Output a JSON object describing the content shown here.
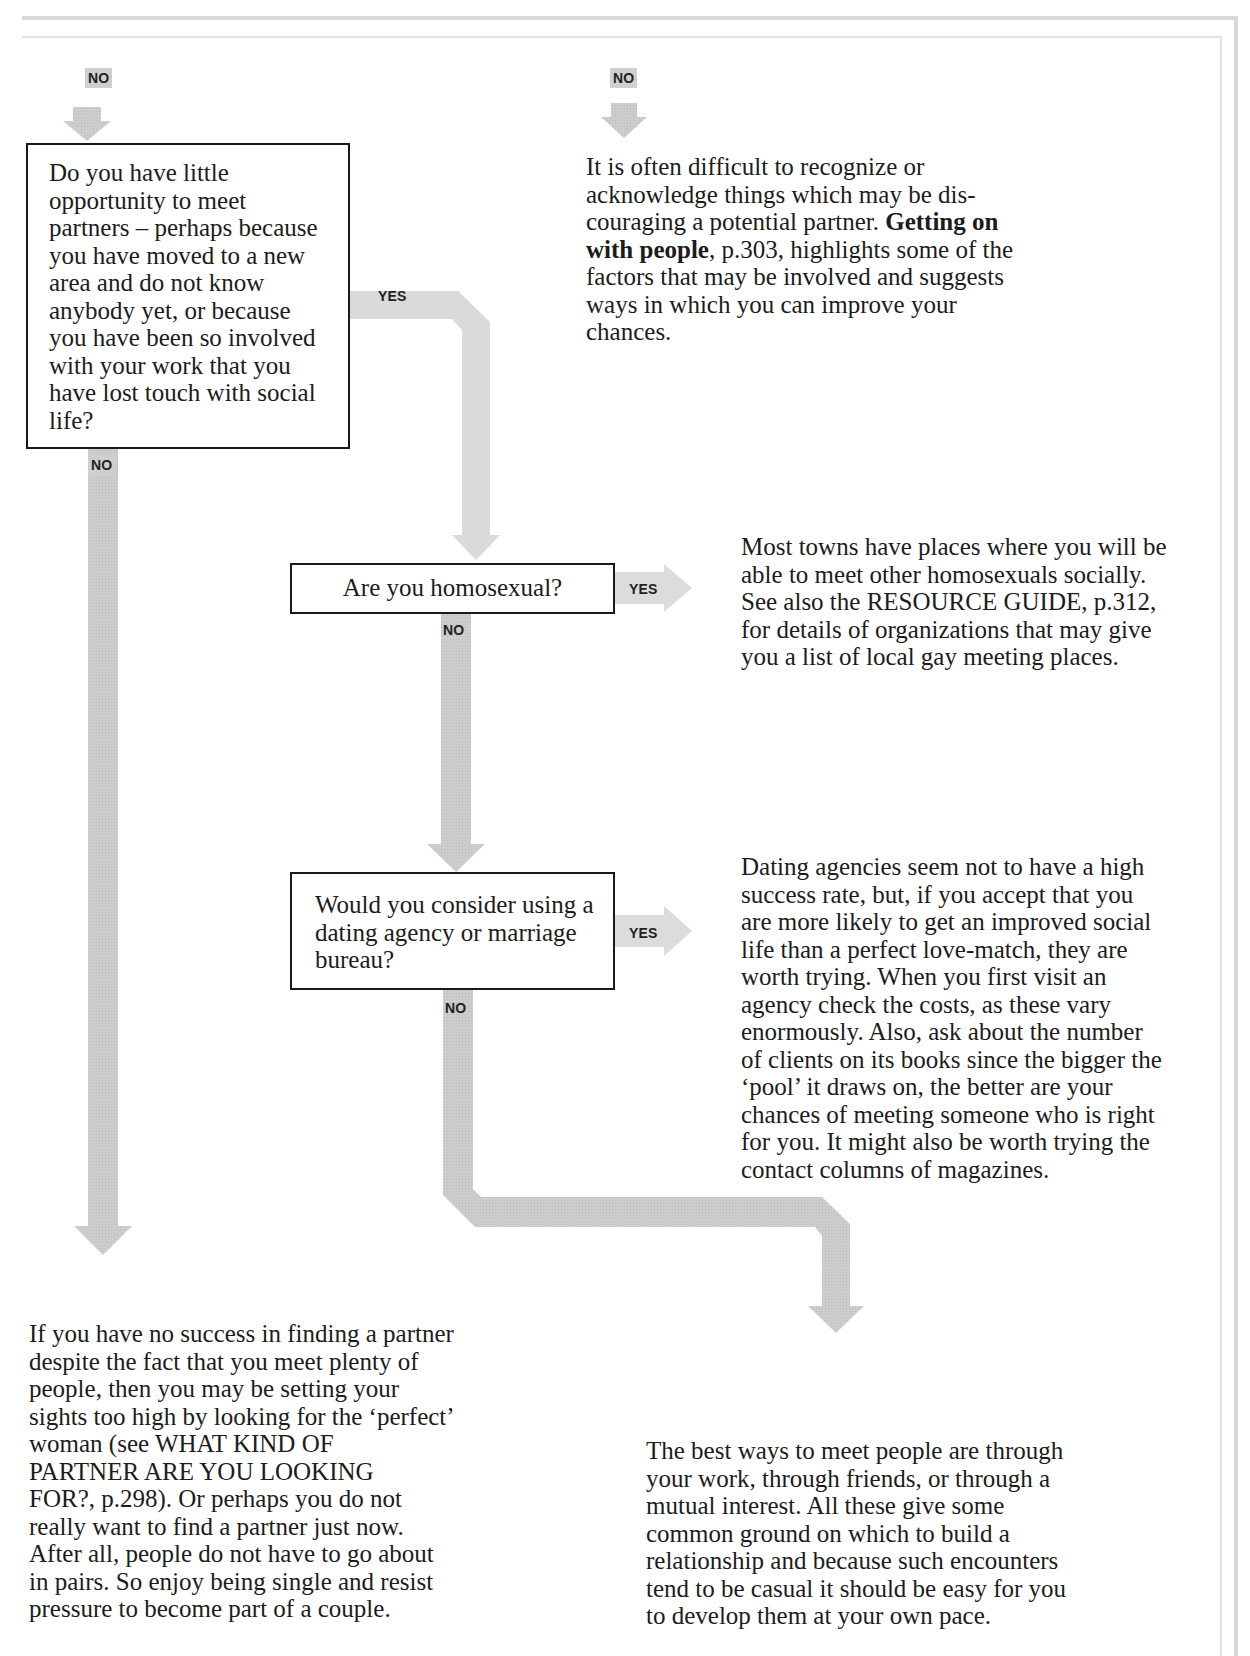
{
  "flowchart": {
    "labels": {
      "no": "NO",
      "yes": "YES"
    },
    "questions": [
      {
        "id": "q1",
        "text": "Do you have little opportunity to meet partners – perhaps because you have moved to a new area and do not know anybody yet, or because you have been so involved with your work that you have lost touch with social life?",
        "lines": [
          "Do you have little",
          "opportunity to meet",
          "partners – perhaps because",
          "you have moved to a new",
          "area and do not know",
          "anybody yet, or because",
          "you have been so involved",
          "with your work that you",
          "have lost touch with social",
          "life?"
        ]
      },
      {
        "id": "q2",
        "text": "Are you homosexual?"
      },
      {
        "id": "q3",
        "text": "Would you consider using a dating agency or marriage bureau?",
        "lines": [
          "Would you consider using a",
          "dating agency or marriage",
          "bureau?"
        ]
      }
    ],
    "answers": {
      "top_right": {
        "lines": [
          "It is often difficult to recognize or",
          "acknowledge things which may be dis-",
          "couraging a potential partner. ",
          "Getting on",
          "with people",
          ", p.303, highlights some of the",
          "factors that may be involved and suggests",
          "ways in which you can improve your",
          "chances."
        ],
        "bold_ref": "Getting on with people",
        "page_ref": "p.303"
      },
      "homosexual_yes": {
        "lines": [
          "Most towns have places where you will be",
          "able to meet other homosexuals socially.",
          "See also the RESOURCE GUIDE, p.312,",
          "for details of organizations that may give",
          "you a list of local gay meeting places."
        ]
      },
      "agency_yes": {
        "lines": [
          "Dating agencies seem not to have a high",
          "success rate, but, if you accept that you",
          "are more likely to get an improved social",
          "life than a perfect love-match, they are",
          "worth trying. When you first visit an",
          "agency check the costs, as these vary",
          "enormously. Also, ask about the number",
          "of clients on its books since the bigger the",
          "‘pool’ it draws on, the better are your",
          "chances of meeting someone who is right",
          "for you. It might also be worth trying the",
          "contact columns of magazines."
        ]
      },
      "no_success": {
        "lines": [
          "If you have no success in finding a partner",
          "despite the fact that you meet plenty of",
          "people, then you may be setting your",
          "sights too high by looking for the ‘perfect’",
          "woman (see WHAT KIND OF",
          "PARTNER ARE YOU LOOKING",
          "FOR?, p.298). Or perhaps you do not",
          "really want to find a partner just now.",
          "After all, people do not have to go about",
          "in pairs. So enjoy being single and resist",
          "pressure to become part of a couple."
        ]
      },
      "best_ways": {
        "lines": [
          "The best ways to meet people are through",
          "your work, through friends, or through a",
          "mutual interest. All these give some",
          "common ground on which to build a",
          "relationship and because such encounters",
          "tend to be casual it should be easy for you",
          "to develop them at your own pace."
        ]
      }
    },
    "colors": {
      "arrow": "#cfcfcf",
      "arrow_light": "#dcdcdc",
      "box_border": "#1a1a1a",
      "text": "#1c1c1c"
    }
  }
}
